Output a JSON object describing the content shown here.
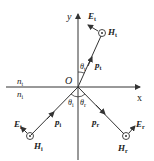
{
  "diagram": {
    "title": "",
    "axes": {
      "x_label": "x",
      "y_label": "y",
      "origin_label": "O"
    },
    "media": {
      "upper": "n",
      "upper_sub": "t",
      "lower": "n",
      "lower_sub": "i"
    },
    "transmitted": {
      "E": "E",
      "E_sub": "t",
      "H": "H",
      "H_sub": "t",
      "p": "p",
      "p_sub": "t",
      "theta": "θ",
      "theta_sub": "t"
    },
    "incident": {
      "E": "E",
      "E_sub": "i",
      "H": "H",
      "H_sub": "i",
      "p": "p",
      "p_sub": "i",
      "theta": "θ",
      "theta_sub": "i"
    },
    "reflected": {
      "E": "E",
      "E_sub": "r",
      "H": "H",
      "H_sub": "r",
      "p": "p",
      "p_sub": "r",
      "theta": "θ",
      "theta_sub": "r"
    },
    "colors": {
      "line": "#333333",
      "text": "#222222"
    }
  }
}
